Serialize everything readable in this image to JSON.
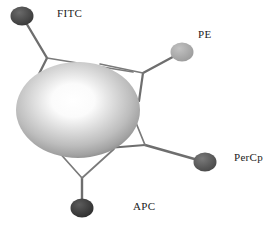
{
  "figure": {
    "background_color": "#ffffff",
    "width": 278,
    "height": 226
  },
  "core": {
    "name": "central-sphere",
    "shape": "ellipse",
    "cx": 78,
    "cy": 110,
    "rx": 62,
    "ry": 48,
    "center_color": "#ffffff",
    "mid_color": "#c9c9c9",
    "edge_color": "#8e8e8e",
    "highlight_cx": 72,
    "highlight_cy": 100
  },
  "linker_color": "#6e6e6e",
  "nodes": [
    {
      "id": "fitc",
      "label": "FITC",
      "dot_color": "#4a4a4a",
      "dot_cx": 22,
      "dot_cy": 16,
      "dot_rx": 11,
      "dot_ry": 9,
      "joint_x": 47,
      "joint_y": 58,
      "arm1_x": 36,
      "arm1_y": 78,
      "arm2_x": 131,
      "arm2_y": 71,
      "label_x": 57,
      "label_y": 7
    },
    {
      "id": "pe",
      "label": "PE",
      "dot_color": "#a8a8a8",
      "dot_cx": 182,
      "dot_cy": 52,
      "dot_rx": 11,
      "dot_ry": 9,
      "joint_x": 143,
      "joint_y": 73,
      "arm1_x": 139,
      "arm1_y": 101,
      "arm2_x": 108,
      "arm2_y": 67,
      "label_x": 198,
      "label_y": 28
    },
    {
      "id": "percp",
      "label": "PerCp",
      "dot_color": "#5a5a5a",
      "dot_cx": 205,
      "dot_cy": 162,
      "dot_rx": 11,
      "dot_ry": 9,
      "joint_x": 145,
      "joint_y": 145,
      "arm1_x": 113,
      "arm1_y": 147,
      "arm2_x": 133,
      "arm2_y": 110,
      "label_x": 234,
      "label_y": 151
    },
    {
      "id": "apc",
      "label": "APC",
      "dot_color": "#3c3c3c",
      "dot_cx": 82,
      "dot_cy": 208,
      "dot_rx": 11,
      "dot_ry": 9,
      "joint_x": 82,
      "joint_y": 178,
      "arm1_x": 59,
      "arm1_y": 152,
      "arm2_x": 112,
      "arm2_y": 150,
      "label_x": 133,
      "label_y": 200
    }
  ]
}
